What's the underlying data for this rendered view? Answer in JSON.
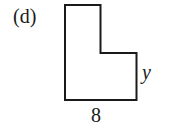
{
  "figure": {
    "part_label": "(d)",
    "shape": "L-shaped polygon",
    "dimensions": {
      "right_side_label": "y",
      "bottom_side_label": "8"
    },
    "colors": {
      "stroke": "#1a1a1a",
      "background": "#ffffff"
    }
  }
}
